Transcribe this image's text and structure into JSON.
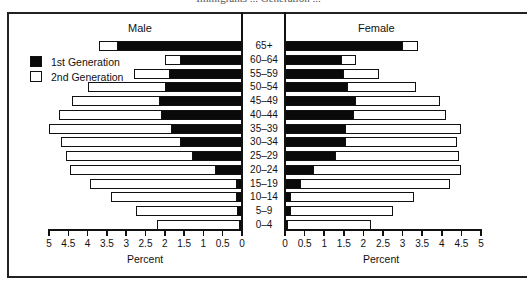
{
  "caption_partial": "Immigrants ... Generation ...",
  "chart_data": {
    "type": "bar",
    "subtype": "population-pyramid-stacked",
    "title": "",
    "panels": [
      "Male",
      "Female"
    ],
    "categories": [
      "65+",
      "60–64",
      "55–59",
      "50–54",
      "45–49",
      "40–44",
      "35–39",
      "30–34",
      "25–29",
      "20–24",
      "15–19",
      "10–14",
      "5–9",
      "0–4"
    ],
    "series": [
      {
        "name": "1st Generation",
        "color": "#0a0a0a",
        "male": [
          3.25,
          1.6,
          1.9,
          2.0,
          2.15,
          2.1,
          1.85,
          1.6,
          1.3,
          0.7,
          0.15,
          0.15,
          0.12,
          0.08
        ],
        "female": [
          3.0,
          1.45,
          1.5,
          1.6,
          1.8,
          1.75,
          1.55,
          1.55,
          1.3,
          0.75,
          0.4,
          0.15,
          0.15,
          0.08
        ]
      },
      {
        "name": "2nd Generation",
        "color": "#ffffff",
        "male": [
          0.45,
          0.4,
          0.9,
          2.0,
          2.25,
          2.65,
          3.15,
          3.1,
          3.25,
          3.75,
          3.8,
          3.25,
          2.63,
          2.12
        ],
        "female": [
          0.4,
          0.35,
          0.9,
          1.75,
          2.15,
          2.35,
          2.95,
          2.85,
          3.15,
          3.75,
          3.8,
          3.15,
          2.6,
          2.12
        ]
      }
    ],
    "totals": {
      "male": [
        3.7,
        2.0,
        2.8,
        4.0,
        4.4,
        4.75,
        5.0,
        4.7,
        4.55,
        4.45,
        3.95,
        3.4,
        2.75,
        2.2
      ],
      "female": [
        3.4,
        1.8,
        2.4,
        3.35,
        3.95,
        4.1,
        4.5,
        4.4,
        4.45,
        4.5,
        4.2,
        3.3,
        2.75,
        2.2
      ]
    },
    "xlabel": "Percent",
    "ylabel": "",
    "xlim": [
      0,
      5
    ],
    "xticks": [
      "0",
      "0.5",
      "1",
      "1.5",
      "2",
      "2.5",
      "3",
      "3.5",
      "4",
      "4.5",
      "5"
    ],
    "grid": false,
    "legend_position": "upper-left (male panel)"
  },
  "labels": {
    "male": "Male",
    "female": "Female",
    "xlabel_left": "Percent",
    "xlabel_right": "Percent",
    "legend": [
      "1st Generation",
      "2nd Generation"
    ]
  }
}
